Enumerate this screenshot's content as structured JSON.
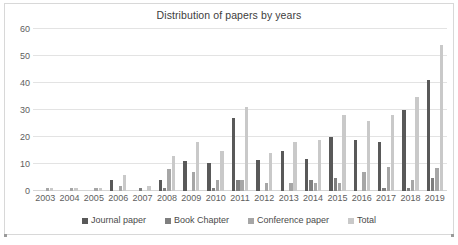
{
  "chart_data": {
    "type": "bar",
    "title": "Distribution of papers by years",
    "xlabel": "",
    "ylabel": "",
    "ylim": [
      0,
      60
    ],
    "yticks": [
      0,
      10,
      20,
      30,
      40,
      50,
      60
    ],
    "grid": true,
    "legend_position": "bottom",
    "categories": [
      "2003",
      "2004",
      "2005",
      "2006",
      "2007",
      "2008",
      "2009",
      "2010",
      "2011",
      "2012",
      "2013",
      "2014",
      "2015",
      "2016",
      "2017",
      "2018",
      "2019"
    ],
    "series": [
      {
        "name": "Journal paper",
        "color": "#595959",
        "values": [
          0,
          0,
          0,
          4,
          0,
          4,
          11,
          10.5,
          27,
          11.5,
          15,
          12,
          20,
          19,
          18,
          30,
          41
        ]
      },
      {
        "name": "Book Chapter",
        "color": "#7f7f7f",
        "values": [
          0,
          0,
          0,
          0,
          1,
          1,
          0,
          1,
          4,
          0,
          0,
          4,
          5,
          0,
          1,
          1,
          5
        ]
      },
      {
        "name": "Conference paper",
        "color": "#a6a6a6",
        "values": [
          1,
          1,
          1,
          2,
          0,
          8,
          7,
          4,
          4,
          3,
          3,
          3,
          3,
          7,
          9,
          4,
          8.5
        ]
      },
      {
        "name": "Total",
        "color": "#c9c9c9",
        "values": [
          1,
          1,
          1,
          6,
          2,
          13,
          18,
          15,
          31,
          14,
          18,
          19,
          28,
          26,
          28,
          35,
          54
        ]
      }
    ]
  },
  "legend": {
    "items": [
      {
        "label": "Journal paper",
        "color": "#595959"
      },
      {
        "label": "Book Chapter",
        "color": "#7f7f7f"
      },
      {
        "label": "Conference paper",
        "color": "#a6a6a6"
      },
      {
        "label": "Total",
        "color": "#c9c9c9"
      }
    ]
  }
}
